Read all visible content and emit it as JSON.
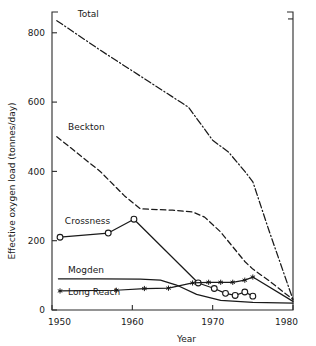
{
  "chart_data": {
    "type": "line",
    "title": "",
    "xlabel": "Year",
    "ylabel": "Effective oxygen load (tonnes/day)",
    "xlim": [
      1950,
      1980
    ],
    "ylim": [
      0,
      860
    ],
    "xticks": [
      1950,
      1960,
      1970,
      1980
    ],
    "xtick_labels": [
      "1950",
      "1960",
      "1970",
      "1980"
    ],
    "yticks": [
      0,
      200,
      400,
      600,
      800
    ],
    "ytick_labels": [
      "0",
      "200",
      "400",
      "600",
      "800"
    ],
    "grid": false,
    "legend": "inline-labels",
    "series": [
      {
        "name": "Total",
        "label": "Total",
        "style": "dash-dot",
        "marker": "none",
        "label_x": 1953.2,
        "label_y": 845,
        "x": [
          1950.6,
          1956.0,
          1960.0,
          1963.0,
          1966.0,
          1967.0,
          1970.0,
          1972.0,
          1974.0,
          1975.0,
          1977.0,
          1980.0
        ],
        "y": [
          835,
          750,
          690,
          645,
          600,
          585,
          490,
          455,
          400,
          370,
          230,
          30
        ]
      },
      {
        "name": "Beckton",
        "label": "Beckton",
        "style": "dashed",
        "marker": "none",
        "label_x": 1952.0,
        "label_y": 520,
        "x": [
          1950.6,
          1956.0,
          1959.0,
          1961.0,
          1965.0,
          1967.5,
          1969.0,
          1971.0,
          1974.0,
          1975.0,
          1977.0,
          1980.0
        ],
        "y": [
          500,
          400,
          330,
          292,
          288,
          283,
          268,
          225,
          140,
          118,
          85,
          30
        ]
      },
      {
        "name": "Crossness",
        "label": "Crossness",
        "style": "solid",
        "marker": "open-circle",
        "label_x": 1951.6,
        "label_y": 247,
        "x": [
          1951.0,
          1957.0,
          1960.2,
          1968.2,
          1970.2,
          1971.6,
          1972.8,
          1974.0,
          1975.0
        ],
        "y": [
          210,
          222,
          262,
          78,
          62,
          48,
          42,
          52,
          40
        ]
      },
      {
        "name": "Mogden",
        "label": "Mogden",
        "style": "solid",
        "marker": "none",
        "label_x": 1952.0,
        "label_y": 108,
        "x": [
          1950.8,
          1956.0,
          1961.0,
          1963.5,
          1965.5,
          1968.0,
          1971.0,
          1975.0,
          1980.0
        ],
        "y": [
          90,
          90,
          89,
          86,
          72,
          45,
          28,
          22,
          20
        ]
      },
      {
        "name": "Long Reach",
        "label": "Long Reach",
        "style": "solid",
        "marker": "star",
        "label_x": 1952.0,
        "label_y": 42,
        "x": [
          1951.0,
          1958.0,
          1961.5,
          1964.5,
          1967.5,
          1969.5,
          1971.0,
          1972.5,
          1974.0,
          1975.0,
          1980.0
        ],
        "y": [
          55,
          57,
          62,
          63,
          78,
          80,
          80,
          80,
          86,
          95,
          25
        ]
      }
    ]
  }
}
